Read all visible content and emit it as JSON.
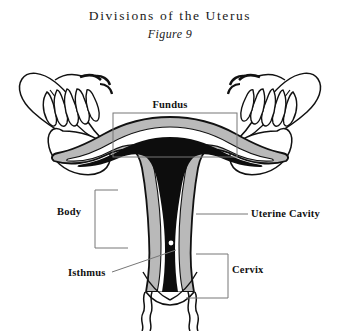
{
  "figure": {
    "title": "Divisions of the Uterus",
    "subtitle": "Figure 9",
    "type": "anatomical-illustration"
  },
  "labels": {
    "fundus": "Fundus",
    "body": "Body",
    "uterine_cavity": "Uterine Cavity",
    "isthmus": "Isthmus",
    "cervix": "Cervix"
  },
  "colors": {
    "background": "#ffffff",
    "outline": "#111111",
    "myometrium_gray": "#b9b9b9",
    "endometrium_white": "#ffffff",
    "cavity_black": "#0d0d0d",
    "leader_line": "#5a5a5a",
    "text": "#111111"
  },
  "structures": [
    {
      "name": "fundus",
      "description": "rounded upper dome of the uterus"
    },
    {
      "name": "body",
      "description": "main corpus of the uterus"
    },
    {
      "name": "uterine-cavity",
      "description": "dark triangular inner cavity"
    },
    {
      "name": "isthmus",
      "description": "narrow constriction between body and cervix"
    },
    {
      "name": "cervix",
      "description": "lower neck of the uterus opening into the vagina"
    },
    {
      "name": "fallopian-tube-left",
      "description": "left oviduct arcing up and laterally"
    },
    {
      "name": "fallopian-tube-right",
      "description": "right oviduct arcing up and laterally"
    },
    {
      "name": "fimbriae-left",
      "description": "finger-like projections at left tube end"
    },
    {
      "name": "fimbriae-right",
      "description": "finger-like projections at right tube end"
    },
    {
      "name": "ovary-left",
      "description": "left ovary beneath the left tube"
    },
    {
      "name": "ovary-right",
      "description": "right ovary beneath the right tube"
    },
    {
      "name": "vaginal-wall",
      "description": "wavy walls extending below the cervix"
    }
  ],
  "leaders": {
    "fundus": "rectangle bracket framing the fundal dome",
    "body": "three-sided bracket open toward the uterine body",
    "uterine_cavity": "horizontal line pointing left into the cavity",
    "isthmus": "diagonal line rising to the isthmic narrowing",
    "cervix": "three-sided bracket open toward the cervix"
  }
}
